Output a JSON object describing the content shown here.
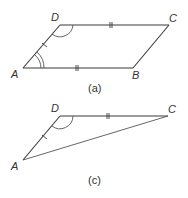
{
  "figures": [
    {
      "id": "a",
      "caption": "(a)",
      "shape": "parallelogram",
      "vertices": [
        "A",
        "B",
        "C",
        "D"
      ],
      "edges": [
        "AB",
        "BC",
        "CD",
        "DA"
      ],
      "equal_marks": {
        "AB": "double",
        "DC": "double",
        "AD": "single"
      },
      "angle_marks": {
        "A": "double-arc",
        "D": "single-arc"
      }
    },
    {
      "id": "c",
      "caption": "(c)",
      "shape": "triangle",
      "vertices": [
        "A",
        "C",
        "D"
      ],
      "edges": [
        "AD",
        "DC",
        "CA"
      ],
      "equal_marks": {
        "DC": "double",
        "AD": "single"
      },
      "angle_marks": {
        "D": "single-arc"
      }
    }
  ],
  "labels": {
    "a": {
      "A": "A",
      "B": "B",
      "C": "C",
      "D": "D"
    },
    "c": {
      "A": "A",
      "C": "C",
      "D": "D"
    }
  }
}
